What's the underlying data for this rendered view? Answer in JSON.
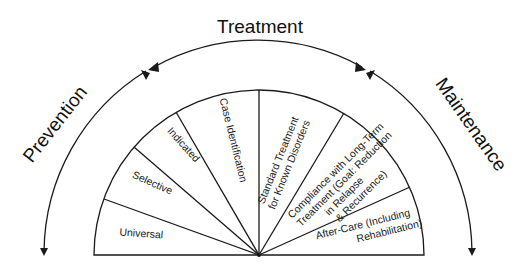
{
  "phases": {
    "prevention": "Prevention",
    "treatment": "Treatment",
    "maintenance": "Maintenance"
  },
  "segments": [
    {
      "id": "universal",
      "lines": [
        "Universal"
      ]
    },
    {
      "id": "selective",
      "lines": [
        "Selective"
      ]
    },
    {
      "id": "indicated",
      "lines": [
        "Indicated"
      ]
    },
    {
      "id": "case-identification",
      "lines": [
        "Case Identification"
      ]
    },
    {
      "id": "standard-treatment",
      "lines": [
        "Standard Treatment",
        "for Known Disorders"
      ]
    },
    {
      "id": "compliance",
      "lines": [
        "Compliance with Long-Term",
        "Treatment (Goal: Reduction",
        "in Relapse",
        "& Recurrence)"
      ]
    },
    {
      "id": "after-care",
      "lines": [
        "After-Care (Including",
        "Rehabilitation)"
      ]
    }
  ],
  "colors": {
    "stroke": "#1a1a1a",
    "background": "#ffffff",
    "text": "#1a1a1a"
  }
}
